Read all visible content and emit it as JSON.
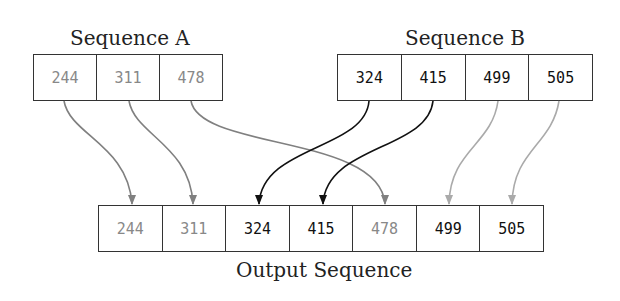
{
  "sequence_a": {
    "title": "Sequence A",
    "values": [
      "244",
      "311",
      "478"
    ]
  },
  "sequence_b": {
    "title": "Sequence B",
    "values": [
      "324",
      "415",
      "499",
      "505"
    ]
  },
  "output": {
    "title": "Output Sequence",
    "values": [
      "244",
      "311",
      "324",
      "415",
      "478",
      "499",
      "505"
    ]
  },
  "colors": {
    "from_a": "#808080",
    "from_b_crossing": "#111111",
    "from_b_direct": "#aaaaaa"
  }
}
